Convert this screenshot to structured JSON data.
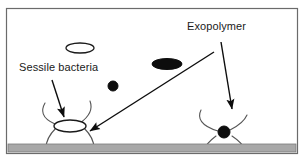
{
  "figure": {
    "type": "schematic-diagram",
    "canvas": {
      "width": 305,
      "height": 167,
      "background": "#ffffff"
    },
    "frame": {
      "name": "outer-border",
      "stroke": "#6b6b6b",
      "x": 6,
      "y": 8,
      "width": 292,
      "height": 146
    },
    "substrate": {
      "name": "surface-substrate",
      "fill": "#a8a8a8",
      "stroke": "#7a7a7a",
      "x": 8,
      "y": 143,
      "width": 288,
      "height": 9
    },
    "labels": [
      {
        "id": "exopolymer",
        "text": "Exopolymer",
        "x": 187,
        "y": 21
      },
      {
        "id": "sessile-bacteria",
        "text": "Sessile bacteria",
        "x": 19,
        "y": 62
      }
    ],
    "cells": [
      {
        "id": "planktonic-ellipse-open",
        "shape": "ellipse",
        "fill": "none",
        "stroke": "#1a1a1a",
        "cx": 80,
        "cy": 48,
        "rx": 14,
        "ry": 5
      },
      {
        "id": "planktonic-ellipse-filled",
        "shape": "ellipse",
        "fill": "#0d0d0d",
        "stroke": "#0d0d0d",
        "cx": 167,
        "cy": 64,
        "rx": 15,
        "ry": 5.5
      },
      {
        "id": "planktonic-coccus-filled",
        "shape": "circle",
        "fill": "#0d0d0d",
        "stroke": "#0d0d0d",
        "cx": 113,
        "cy": 86,
        "r": 5
      },
      {
        "id": "attached-ellipse-open",
        "shape": "ellipse",
        "fill": "#ffffff",
        "stroke": "#1a1a1a",
        "cx": 70,
        "cy": 126,
        "rx": 16,
        "ry": 6
      },
      {
        "id": "attached-coccus-filled",
        "shape": "circle",
        "fill": "#0d0d0d",
        "stroke": "#0d0d0d",
        "cx": 224,
        "cy": 132,
        "r": 6
      }
    ],
    "exopolymer_strands": {
      "stroke": "#555555",
      "groups": [
        {
          "id": "left-cluster-strands",
          "count": 4
        },
        {
          "id": "right-cluster-strands",
          "count": 4
        }
      ]
    },
    "arrows": [
      {
        "id": "sessile-bacteria-pointer",
        "from_label": "sessile-bacteria",
        "to": "attached-ellipse-open",
        "x1": 52,
        "y1": 83,
        "x2": 64,
        "y2": 118
      },
      {
        "id": "exopolymer-pointer-left",
        "from_label": "exopolymer",
        "to": "left-cluster-strands",
        "x1": 213,
        "y1": 51,
        "x2": 89,
        "y2": 130
      },
      {
        "id": "exopolymer-pointer-right",
        "from_label": "exopolymer",
        "to": "right-cluster-strands",
        "x1": 221,
        "y1": 44,
        "x2": 232,
        "y2": 110
      }
    ],
    "colors": {
      "ink": "#1a1a1a",
      "strand": "#555555",
      "substrate": "#a8a8a8",
      "frame": "#6b6b6b",
      "background": "#ffffff"
    }
  }
}
